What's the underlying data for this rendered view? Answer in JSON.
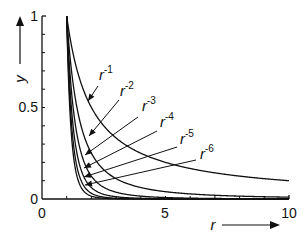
{
  "chart_data": {
    "type": "line",
    "title": "",
    "xlabel": "r",
    "ylabel": "y",
    "xlim": [
      0,
      10
    ],
    "ylim": [
      0,
      1
    ],
    "grid": false,
    "legend": "inline arrow labels",
    "x_ticks": [
      "0",
      "5",
      "10"
    ],
    "y_ticks": [
      "0",
      "0.5",
      "1"
    ],
    "series": [
      {
        "name": "r^-1",
        "label_base": "r",
        "label_exp": "-1",
        "exponent": -1,
        "x_start": 1,
        "x_end": 10
      },
      {
        "name": "r^-2",
        "label_base": "r",
        "label_exp": "-2",
        "exponent": -2,
        "x_start": 1,
        "x_end": 10
      },
      {
        "name": "r^-3",
        "label_base": "r",
        "label_exp": "-3",
        "exponent": -3,
        "x_start": 1,
        "x_end": 10
      },
      {
        "name": "r^-4",
        "label_base": "r",
        "label_exp": "-4",
        "exponent": -4,
        "x_start": 1,
        "x_end": 10
      },
      {
        "name": "r^-5",
        "label_base": "r",
        "label_exp": "-5",
        "exponent": -5,
        "x_start": 1,
        "x_end": 10
      },
      {
        "name": "r^-6",
        "label_base": "r",
        "label_exp": "-6",
        "exponent": -6,
        "x_start": 1,
        "x_end": 10
      }
    ]
  },
  "axes": {
    "x_label": "r",
    "y_label": "y",
    "x_tick_labels": [
      "0",
      "5",
      "10"
    ],
    "y_tick_labels": [
      "0",
      "0.5",
      "1"
    ]
  },
  "labels": [
    {
      "base": "r",
      "exp": "-1"
    },
    {
      "base": "r",
      "exp": "-2"
    },
    {
      "base": "r",
      "exp": "-3"
    },
    {
      "base": "r",
      "exp": "-4"
    },
    {
      "base": "r",
      "exp": "-5"
    },
    {
      "base": "r",
      "exp": "-6"
    }
  ]
}
